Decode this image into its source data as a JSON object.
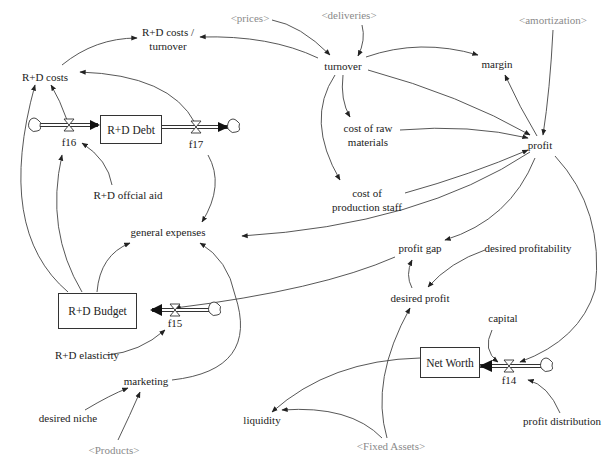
{
  "diagram": {
    "type": "stock-and-flow",
    "stocks": [
      {
        "id": "rd_debt",
        "label": "R+D Debt"
      },
      {
        "id": "rd_budget",
        "label": "R+D Budget"
      },
      {
        "id": "net_worth",
        "label": "Net Worth"
      }
    ],
    "flows": [
      {
        "id": "f16",
        "label": "f16",
        "to": "R+D Debt"
      },
      {
        "id": "f17",
        "label": "f17",
        "from": "R+D Debt"
      },
      {
        "id": "f15",
        "label": "f15",
        "to": "R+D Budget"
      },
      {
        "id": "f14",
        "label": "f14",
        "to": "Net Worth"
      }
    ],
    "variables": {
      "rd_costs_turnover": "R+D costs /",
      "rd_costs_turnover_2": "turnover",
      "rd_costs": "R+D costs",
      "turnover": "turnover",
      "margin": "margin",
      "cost_raw_1": "cost of raw",
      "cost_raw_2": "materials",
      "profit": "profit",
      "rd_official_aid": "R+D offcial aid",
      "cost_staff_1": "cost of",
      "cost_staff_2": "production staff",
      "general_expenses": "general expenses",
      "profit_gap": "profit gap",
      "desired_profitability": "desired profitability",
      "desired_profit": "desired profit",
      "capital": "capital",
      "rd_elasticity": "R+D elasticity",
      "marketing": "marketing",
      "desired_niche": "desired niche",
      "liquidity": "liquidity",
      "profit_distribution": "profit distribution"
    },
    "shadow_variables": {
      "prices": "<prices>",
      "deliveries": "<deliveries>",
      "amortization": "<amortization>",
      "products": "<Products>",
      "fixed_assets": "<Fixed Assets>"
    },
    "colors": {
      "line": "#333333",
      "shadow_text": "#8a8a8a",
      "text": "#222222"
    }
  }
}
